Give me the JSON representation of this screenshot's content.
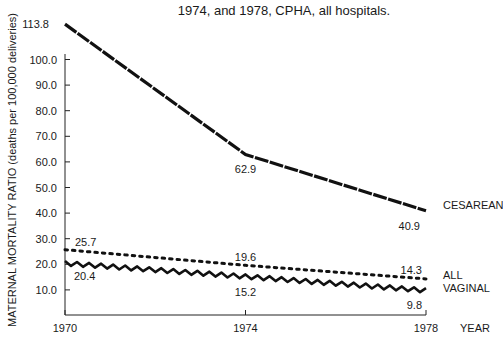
{
  "chart_data": {
    "type": "line",
    "title": "1974, and 1978, CPHA, all hospitals.",
    "xlabel": "YEAR",
    "ylabel": "MATERNAL MORTALITY RATIO (deaths per 100,000 deliveries)",
    "x": [
      1970,
      1974,
      1978
    ],
    "x_tick_labels": [
      "1970",
      "1974",
      "1978"
    ],
    "y_tick_labels": [
      "10.0",
      "20.0",
      "30.0",
      "40.0",
      "50.0",
      "60.0",
      "70.0",
      "80.0",
      "90.0",
      "100.0"
    ],
    "y_ticks": [
      10,
      20,
      30,
      40,
      50,
      60,
      70,
      80,
      90,
      100
    ],
    "ylim": [
      0,
      113.8
    ],
    "grid": false,
    "series": [
      {
        "name": "CESAREAN",
        "style": "dashed-heavy",
        "values": [
          113.8,
          62.9,
          40.9
        ],
        "labels": [
          "113.8",
          "62.9",
          "40.9"
        ]
      },
      {
        "name": "ALL",
        "style": "dotted",
        "values": [
          25.7,
          19.6,
          14.3
        ],
        "labels": [
          "25.7",
          "19.6",
          "14.3"
        ]
      },
      {
        "name": "VAGINAL",
        "style": "wavy",
        "values": [
          20.4,
          15.2,
          9.8
        ],
        "labels": [
          "20.4",
          "15.2",
          "9.8"
        ]
      }
    ]
  }
}
